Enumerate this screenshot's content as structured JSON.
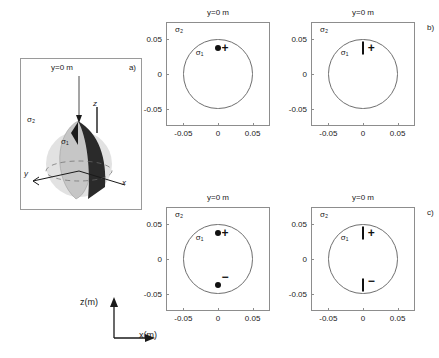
{
  "figure": {
    "panel_a": {
      "tag": "a)",
      "title": "y=0 m",
      "sigma_outer": "σ₂",
      "sigma_inner": "σ₁",
      "axis_z": "z",
      "axis_x": "x",
      "axis_y": "y"
    },
    "axes_indicator": {
      "z_label": "z(m)",
      "x_label": "x(m)"
    },
    "panels": [
      {
        "key": "top-left",
        "tag": "",
        "title": "y=0 m",
        "sigma_outer": "σ₂",
        "sigma_inner": "σ₁"
      },
      {
        "key": "top-right",
        "tag": "b)",
        "title": "y=0 m",
        "sigma_outer": "σ₂",
        "sigma_inner": "σ₁"
      },
      {
        "key": "bottom-left",
        "tag": "",
        "title": "y=0 m",
        "sigma_outer": "σ₂",
        "sigma_inner": "σ₁"
      },
      {
        "key": "bottom-right",
        "tag": "c)",
        "title": "y=0 m",
        "sigma_outer": "σ₂",
        "sigma_inner": "σ₁"
      }
    ]
  },
  "chart_data": [
    {
      "key": "top-left",
      "type": "scatter",
      "title": "y=0 m",
      "xlabel": "x(m)",
      "ylabel": "z(m)",
      "xlim": [
        -0.075,
        0.075
      ],
      "ylim": [
        -0.075,
        0.075
      ],
      "xticks": [
        -0.05,
        0,
        0.05
      ],
      "xticklabels": [
        "-0.05",
        "0",
        "0.05"
      ],
      "yticks": [
        0.05,
        0,
        -0.05
      ],
      "yticklabels": [
        "0.05",
        "0",
        "-0.05"
      ],
      "grid": false,
      "legend": "none",
      "annotations": [
        {
          "text": "σ₂",
          "x": -0.062,
          "z": 0.064
        },
        {
          "text": "σ₁",
          "x": -0.032,
          "z": 0.03
        }
      ],
      "shapes": [
        {
          "type": "circle",
          "cx": 0,
          "cz": 0,
          "r": 0.05
        }
      ],
      "markers": [
        {
          "style": "dot",
          "x": 0.0,
          "z": 0.038,
          "sign": "+",
          "sign_x": 0.01,
          "sign_z": 0.038
        }
      ]
    },
    {
      "key": "top-right",
      "type": "scatter",
      "title": "y=0 m",
      "xlabel": "x(m)",
      "ylabel": "z(m)",
      "xlim": [
        -0.075,
        0.075
      ],
      "ylim": [
        -0.075,
        0.075
      ],
      "xticks": [
        -0.05,
        0,
        0.05
      ],
      "xticklabels": [
        "-0.05",
        "0",
        "0.05"
      ],
      "yticks": [
        0.05,
        0,
        -0.05
      ],
      "yticklabels": [
        "0.05",
        "0",
        "-0.05"
      ],
      "grid": false,
      "legend": "none",
      "annotations": [
        {
          "text": "σ₂",
          "x": -0.062,
          "z": 0.064
        },
        {
          "text": "σ₁",
          "x": -0.032,
          "z": 0.03
        }
      ],
      "shapes": [
        {
          "type": "circle",
          "cx": 0,
          "cz": 0,
          "r": 0.05
        }
      ],
      "markers": [
        {
          "style": "bar",
          "x": 0.0,
          "z": 0.038,
          "sign": "+",
          "sign_x": 0.012,
          "sign_z": 0.038
        }
      ]
    },
    {
      "key": "bottom-left",
      "type": "scatter",
      "title": "y=0 m",
      "xlabel": "x(m)",
      "ylabel": "z(m)",
      "xlim": [
        -0.075,
        0.075
      ],
      "ylim": [
        -0.075,
        0.075
      ],
      "xticks": [
        -0.05,
        0,
        0.05
      ],
      "xticklabels": [
        "-0.05",
        "0",
        "0.05"
      ],
      "yticks": [
        0.05,
        0,
        -0.05
      ],
      "yticklabels": [
        "0.05",
        "0",
        "-0.05"
      ],
      "grid": false,
      "legend": "none",
      "annotations": [
        {
          "text": "σ₂",
          "x": -0.062,
          "z": 0.064
        },
        {
          "text": "σ₁",
          "x": -0.032,
          "z": 0.03
        }
      ],
      "shapes": [
        {
          "type": "circle",
          "cx": 0,
          "cz": 0,
          "r": 0.05
        }
      ],
      "markers": [
        {
          "style": "dot",
          "x": 0.0,
          "z": 0.038,
          "sign": "+",
          "sign_x": 0.01,
          "sign_z": 0.038
        },
        {
          "style": "dot",
          "x": 0.0,
          "z": -0.038,
          "sign": "−",
          "sign_x": 0.01,
          "sign_z": -0.026
        }
      ]
    },
    {
      "key": "bottom-right",
      "type": "scatter",
      "title": "y=0 m",
      "xlabel": "x(m)",
      "ylabel": "z(m)",
      "xlim": [
        -0.075,
        0.075
      ],
      "ylim": [
        -0.075,
        0.075
      ],
      "xticks": [
        -0.05,
        0,
        0.05
      ],
      "xticklabels": [
        "-0.05",
        "0",
        "0.05"
      ],
      "yticks": [
        0.05,
        0,
        -0.05
      ],
      "yticklabels": [
        "0.05",
        "0",
        "-0.05"
      ],
      "grid": false,
      "legend": "none",
      "annotations": [
        {
          "text": "σ₂",
          "x": -0.062,
          "z": 0.064
        },
        {
          "text": "σ₁",
          "x": -0.032,
          "z": 0.03
        }
      ],
      "shapes": [
        {
          "type": "circle",
          "cx": 0,
          "cz": 0,
          "r": 0.05
        }
      ],
      "markers": [
        {
          "style": "bar",
          "x": 0.0,
          "z": 0.038,
          "sign": "+",
          "sign_x": 0.012,
          "sign_z": 0.038
        },
        {
          "style": "bar",
          "x": 0.0,
          "z": -0.038,
          "sign": "−",
          "sign_x": 0.012,
          "sign_z": -0.032
        }
      ]
    }
  ],
  "colors": {
    "frame": "#8d8d8d",
    "circle": "#6f6f6f",
    "marker": "#111111",
    "sphere_light": "#d9d9d9",
    "sphere_mid": "#bdbdbd",
    "wedge_dark": "#1a1a1a"
  }
}
